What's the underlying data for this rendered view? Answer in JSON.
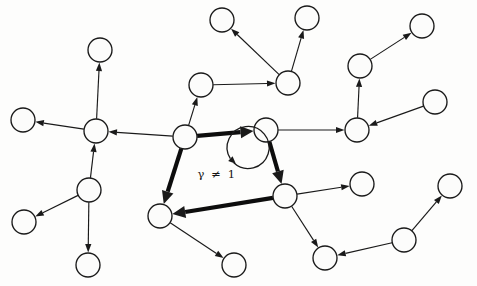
{
  "figure": {
    "kind": "directed-graph-diagram",
    "title": "",
    "background_color": "#fdfdfc",
    "stroke_color": "#1a1a1a",
    "node_fill": "#fcfcfb",
    "node_radius": 12,
    "width": 477,
    "height": 286
  },
  "annotation": {
    "cycle_label": "γ ≠ 1",
    "cycle_label_x": 217,
    "cycle_label_y": 178,
    "arc_center_x": 216,
    "arc_center_y": 174,
    "arc_radius": 21,
    "arc_direction": "counterclockwise-to-up-right"
  },
  "nodes": [
    {
      "id": "n0",
      "label": "",
      "x": 23,
      "y": 120
    },
    {
      "id": "n1",
      "label": "",
      "x": 100,
      "y": 50
    },
    {
      "id": "n2",
      "label": "",
      "x": 96,
      "y": 131
    },
    {
      "id": "n3",
      "label": "",
      "x": 89,
      "y": 190
    },
    {
      "id": "n4",
      "label": "",
      "x": 24,
      "y": 222
    },
    {
      "id": "n5",
      "label": "",
      "x": 88,
      "y": 265
    },
    {
      "id": "n6",
      "label": "",
      "x": 201,
      "y": 85
    },
    {
      "id": "n7",
      "label": "",
      "x": 222,
      "y": 20
    },
    {
      "id": "n8",
      "label": "",
      "x": 288,
      "y": 83
    },
    {
      "id": "n9",
      "label": "",
      "x": 307,
      "y": 18
    },
    {
      "id": "n10",
      "label": "",
      "x": 422,
      "y": 26
    },
    {
      "id": "n11",
      "label": "",
      "x": 360,
      "y": 66
    },
    {
      "id": "n12",
      "label": "",
      "x": 435,
      "y": 102
    },
    {
      "id": "n13",
      "label": "",
      "x": 357,
      "y": 130
    },
    {
      "id": "n14",
      "label": "",
      "x": 185,
      "y": 137
    },
    {
      "id": "n15",
      "label": "",
      "x": 266,
      "y": 130
    },
    {
      "id": "n16",
      "label": "",
      "x": 285,
      "y": 196
    },
    {
      "id": "n17",
      "label": "",
      "x": 160,
      "y": 216
    },
    {
      "id": "n18",
      "label": "",
      "x": 234,
      "y": 265
    },
    {
      "id": "n19",
      "label": "",
      "x": 362,
      "y": 184
    },
    {
      "id": "n20",
      "label": "",
      "x": 325,
      "y": 258
    },
    {
      "id": "n21",
      "label": "",
      "x": 404,
      "y": 240
    },
    {
      "id": "n22",
      "label": "",
      "x": 450,
      "y": 186
    }
  ],
  "edges": [
    {
      "from": "n2",
      "to": "n0",
      "bold": false,
      "arrow": true
    },
    {
      "from": "n2",
      "to": "n1",
      "bold": false,
      "arrow": true
    },
    {
      "from": "n3",
      "to": "n2",
      "bold": false,
      "arrow": true
    },
    {
      "from": "n3",
      "to": "n4",
      "bold": false,
      "arrow": true
    },
    {
      "from": "n3",
      "to": "n5",
      "bold": false,
      "arrow": true
    },
    {
      "from": "n14",
      "to": "n2",
      "bold": false,
      "arrow": true
    },
    {
      "from": "n14",
      "to": "n6",
      "bold": false,
      "arrow": true
    },
    {
      "from": "n6",
      "to": "n8",
      "bold": false,
      "arrow": true
    },
    {
      "from": "n8",
      "to": "n7",
      "bold": false,
      "arrow": true
    },
    {
      "from": "n8",
      "to": "n9",
      "bold": false,
      "arrow": true
    },
    {
      "from": "n11",
      "to": "n10",
      "bold": false,
      "arrow": true
    },
    {
      "from": "n13",
      "to": "n11",
      "bold": false,
      "arrow": true
    },
    {
      "from": "n12",
      "to": "n13",
      "bold": false,
      "arrow": true
    },
    {
      "from": "n15",
      "to": "n13",
      "bold": false,
      "arrow": true
    },
    {
      "from": "n16",
      "to": "n19",
      "bold": false,
      "arrow": true
    },
    {
      "from": "n16",
      "to": "n20",
      "bold": false,
      "arrow": true
    },
    {
      "from": "n21",
      "to": "n20",
      "bold": false,
      "arrow": true
    },
    {
      "from": "n21",
      "to": "n22",
      "bold": false,
      "arrow": true
    },
    {
      "from": "n17",
      "to": "n18",
      "bold": false,
      "arrow": true
    },
    {
      "from": "n14",
      "to": "n15",
      "bold": true,
      "arrow": true
    },
    {
      "from": "n15",
      "to": "n16",
      "bold": true,
      "arrow": true
    },
    {
      "from": "n16",
      "to": "n17",
      "bold": true,
      "arrow": true
    },
    {
      "from": "n14",
      "to": "n17",
      "bold": true,
      "arrow": true
    }
  ],
  "cycle": {
    "node_ids": [
      "n14",
      "n15",
      "n16",
      "n17"
    ],
    "description": "highlighted directed cycle"
  }
}
